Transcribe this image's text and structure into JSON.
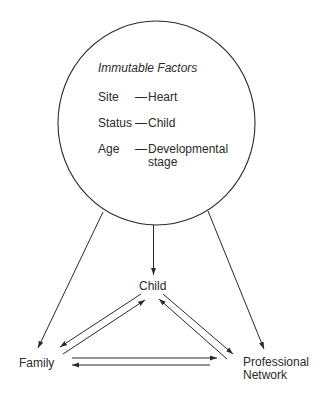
{
  "circle": {
    "title": "Immutable Factors",
    "factors": [
      {
        "key": "Site",
        "dash": "—",
        "value": "Heart",
        "value_line2": ""
      },
      {
        "key": "Status",
        "dash": "—",
        "value": "Child",
        "value_line2": ""
      },
      {
        "key": "Age",
        "dash": "—",
        "value": "Developmental",
        "value_line2": "stage"
      }
    ]
  },
  "nodes": {
    "child": "Child",
    "family": "Family",
    "professional_line1": "Professional",
    "professional_line2": "Network"
  },
  "colors": {
    "stroke": "#2a2a2a",
    "background": "#ffffff"
  }
}
